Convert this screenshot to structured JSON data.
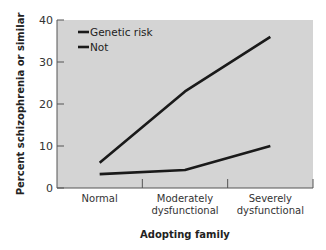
{
  "chart_data": {
    "type": "line",
    "title": "",
    "xlabel": "Adopting family",
    "ylabel": "Percent schizophrenia or similar",
    "categories": [
      "Normal",
      "Moderately dysfunctional",
      "Severely dysfunctional"
    ],
    "category_lines": [
      [
        "Normal"
      ],
      [
        "Moderately",
        "dysfunctional"
      ],
      [
        "Severely",
        "dysfunctional"
      ]
    ],
    "series": [
      {
        "name": "Genetic risk",
        "values": [
          6,
          23,
          36
        ],
        "color": "#1a1a1a"
      },
      {
        "name": "Not",
        "values": [
          3.3,
          4.3,
          10
        ],
        "color": "#1a1a1a"
      }
    ],
    "ylim": [
      0,
      40
    ],
    "yticks": [
      0,
      10,
      20,
      30,
      40
    ],
    "grid": false,
    "legend_position": "upper-left",
    "plot_background": "#d4d4d4"
  }
}
